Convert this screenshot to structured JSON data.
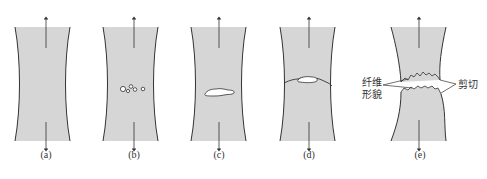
{
  "figure": {
    "colors": {
      "specimen_fill": "#d6d6d6",
      "outline": "#333333",
      "void_fill": "#ffffff"
    },
    "panels": [
      {
        "id": "a",
        "label": "(a)",
        "center_x": 42,
        "stage": "necking"
      },
      {
        "id": "b",
        "label": "(b)",
        "center_x": 130,
        "stage": "microvoid formation"
      },
      {
        "id": "c",
        "label": "(c)",
        "center_x": 219,
        "stage": "void coalescence / crack"
      },
      {
        "id": "d",
        "label": "(d)",
        "center_x": 308,
        "stage": "crack propagation"
      },
      {
        "id": "e",
        "label": "(e)",
        "center_x": 420,
        "stage": "final shear fracture"
      }
    ],
    "annotations": {
      "fibrous_line1": "纤维",
      "fibrous_line2": "形貌",
      "shear": "剪切"
    }
  }
}
